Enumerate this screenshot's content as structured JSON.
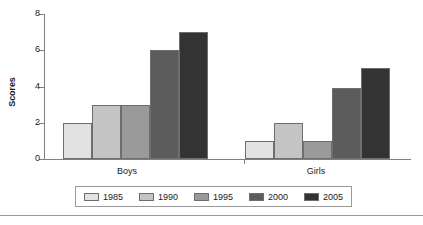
{
  "chart_data": {
    "type": "bar",
    "title": "",
    "xlabel": "",
    "ylabel": "Scores",
    "categories": [
      "Boys",
      "Girls"
    ],
    "series": [
      {
        "name": "1985",
        "color": "#e2e2e2",
        "values": [
          2,
          1
        ]
      },
      {
        "name": "1990",
        "color": "#c4c4c4",
        "values": [
          3,
          2
        ]
      },
      {
        "name": "1995",
        "color": "#9a9a9a",
        "values": [
          3,
          1
        ]
      },
      {
        "name": "2000",
        "color": "#5c5c5c",
        "values": [
          6,
          3.9
        ]
      },
      {
        "name": "2005",
        "color": "#333333",
        "values": [
          7,
          5
        ]
      }
    ],
    "ylim": [
      0,
      8
    ],
    "y_ticks": [
      0,
      2,
      4,
      6,
      8
    ],
    "y_tick_labels": [
      "0",
      "2",
      "4",
      "6",
      "8"
    ],
    "grid": false,
    "legend_position": "bottom"
  },
  "axis": {
    "y_title": "Scores",
    "tick_0": "0",
    "tick_2": "2",
    "tick_4": "4",
    "tick_6": "6",
    "tick_8": "8"
  },
  "groups": {
    "boys_label": "Boys",
    "girls_label": "Girls"
  },
  "legend": {
    "items": [
      {
        "label": "1985"
      },
      {
        "label": "1990"
      },
      {
        "label": "1995"
      },
      {
        "label": "2000"
      },
      {
        "label": "2005"
      }
    ]
  }
}
